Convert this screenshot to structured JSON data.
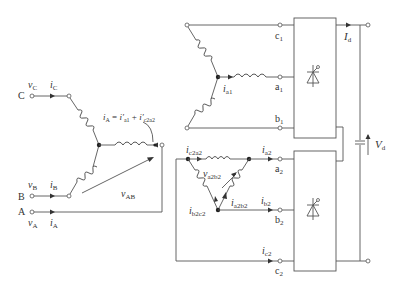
{
  "diagram": {
    "primary": {
      "terminals": [
        {
          "name": "C",
          "voltage": "v",
          "voltage_sub": "C",
          "current": "i",
          "current_sub": "C"
        },
        {
          "name": "B",
          "voltage": "v",
          "voltage_sub": "B",
          "current": "i",
          "current_sub": "B"
        },
        {
          "name": "A",
          "voltage": "v",
          "voltage_sub": "A",
          "current": "i",
          "current_sub": "A"
        }
      ],
      "line_voltage": {
        "sym": "v",
        "sub": "AB"
      },
      "equation": {
        "lhs": "i",
        "lhs_sub": "A",
        "eq": " = ",
        "t1": "i′",
        "t1_sub": "a1",
        "plus": " + ",
        "t2": "i′",
        "t2_sub": "c2a2"
      }
    },
    "secondary_wye": {
      "current": {
        "sym": "i",
        "sub": "a1"
      },
      "terminals": [
        {
          "main": "c",
          "sub": "1"
        },
        {
          "main": "a",
          "sub": "1"
        },
        {
          "main": "b",
          "sub": "1"
        }
      ]
    },
    "secondary_delta": {
      "currents": {
        "c2a2": {
          "sym": "i",
          "sub": "c2a2"
        },
        "a2b2": {
          "sym": "i",
          "sub": "a2b2"
        },
        "b2c2": {
          "sym": "i",
          "sub": "b2c2"
        },
        "a2": {
          "sym": "i",
          "sub": "a2"
        },
        "b2": {
          "sym": "i",
          "sub": "b2"
        },
        "c2": {
          "sym": "i",
          "sub": "c2"
        }
      },
      "voltage": {
        "sym": "v",
        "sub": "a2b2"
      },
      "terminals": [
        {
          "main": "a",
          "sub": "2"
        },
        {
          "main": "b",
          "sub": "2"
        },
        {
          "main": "c",
          "sub": "2"
        }
      ]
    },
    "dc_output": {
      "current": {
        "sym": "I",
        "sub": "d"
      },
      "voltage": {
        "sym": "V",
        "sub": "d"
      }
    },
    "icons": [
      "thyristor-bridge-icon",
      "capacitor-icon",
      "inductor-icon"
    ]
  }
}
